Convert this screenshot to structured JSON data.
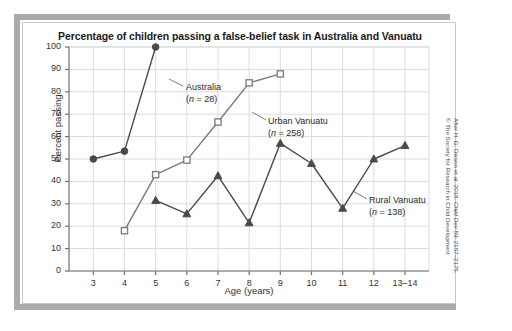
{
  "figure": {
    "title": "Percentage of children passing a false-belief task in Australia and Vanuatu",
    "attribution_line1_prefix": "After H. G. Dixson et al. 2018. ",
    "attribution_line1_italic": "Child Dev",
    "attribution_line1_suffix": " 89: 2157–2175.",
    "attribution_line2": "© The Society for Research in Child Development"
  },
  "labels": {
    "australia_name": "Australia",
    "australia_n": "(n = 28)",
    "australia_n_prefix": "(",
    "australia_n_italic": "n",
    "australia_n_suffix": " = 28)",
    "urban_name": "Urban Vanuatu",
    "urban_n_prefix": "(",
    "urban_n_italic": "n",
    "urban_n_suffix": " = 258)",
    "rural_name": "Rural Vanuatu",
    "rural_n_prefix": "(",
    "rural_n_italic": "n",
    "rural_n_suffix": " = 138)"
  },
  "chart_data": {
    "type": "line",
    "title": "Percentage of children passing a false-belief task in Australia and Vanuatu",
    "xlabel": "Age (years)",
    "ylabel": "Percent passing",
    "x": [
      3,
      4,
      5,
      6,
      7,
      8,
      9,
      10,
      11,
      12,
      13.5
    ],
    "categories": [
      "3",
      "4",
      "5",
      "6",
      "7",
      "8",
      "9",
      "10",
      "11",
      "12",
      "13–14"
    ],
    "xtick_labels": [
      "3",
      "4",
      "5",
      "6",
      "7",
      "8",
      "9",
      "10",
      "11",
      "12",
      "13–14"
    ],
    "ytick_labels": [
      "0",
      "10",
      "20",
      "30",
      "40",
      "50",
      "60",
      "70",
      "80",
      "90",
      "100"
    ],
    "ylim": [
      0,
      100
    ],
    "ytick_step": 10,
    "grid": true,
    "legend_position": "inline-annotations",
    "series": [
      {
        "name": "Australia",
        "n": 28,
        "marker": "filled-circle",
        "color": "#4a4a4a",
        "categories": [
          "3",
          "4",
          "5"
        ],
        "x": [
          3,
          4,
          5
        ],
        "values": [
          50,
          53.5,
          100
        ]
      },
      {
        "name": "Urban Vanuatu",
        "n": 258,
        "marker": "open-square",
        "color": "#7a7a7a",
        "categories": [
          "4",
          "5",
          "6",
          "7",
          "8",
          "9"
        ],
        "x": [
          4,
          5,
          6,
          7,
          8,
          9
        ],
        "values": [
          18,
          43,
          49.5,
          66.5,
          84,
          88
        ]
      },
      {
        "name": "Rural Vanuatu",
        "n": 138,
        "marker": "filled-triangle",
        "color": "#4a4a4a",
        "categories": [
          "5",
          "6",
          "7",
          "8",
          "9",
          "10",
          "11",
          "12",
          "13–14"
        ],
        "x": [
          5,
          6,
          7,
          8,
          9,
          10,
          11,
          12,
          13.5
        ],
        "values": [
          31.5,
          25.5,
          42.5,
          21.5,
          57,
          48,
          28,
          50,
          56
        ]
      }
    ]
  },
  "colors": {
    "frame": "#c7c8ca",
    "shadow": "#a9aaac",
    "grid": "#d9dcde",
    "axis": "#6f7072",
    "dark_series": "#4a4a4a",
    "light_series": "#7a7a7a",
    "text": "#1b1b1b"
  }
}
